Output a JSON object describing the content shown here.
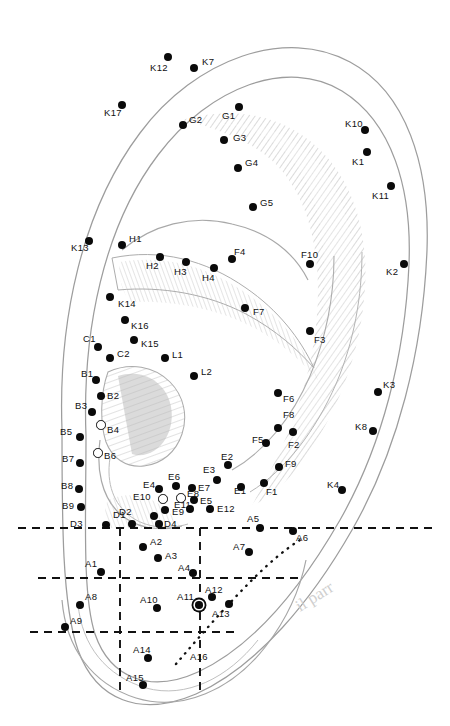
{
  "figure": {
    "subtitle": "Right ear, lateral view with lettered point zones",
    "background_color": "#ffffff",
    "dot_color": "#0a0a0a",
    "outline_color": "#9a9a9a",
    "grid_color": "#111111",
    "watermark_text": "il parr"
  },
  "marker_styles": {
    "filled": "solid black disc",
    "hollow": "open circle outline",
    "target": "black disc with outer ring"
  },
  "chart_data": {
    "type": "scatter",
    "xlabel": "",
    "ylabel": "",
    "xlim": [
      0,
      450
    ],
    "ylim": [
      0,
      726
    ],
    "grid": true,
    "legend": "none",
    "groups": [
      "A",
      "B",
      "C",
      "D",
      "E",
      "F",
      "G",
      "H",
      "K",
      "L"
    ],
    "points": [
      {
        "id": "K12",
        "x": 168,
        "y": 57,
        "lx": 150,
        "ly": 68,
        "style": "filled"
      },
      {
        "id": "K7",
        "x": 194,
        "y": 68,
        "lx": 202,
        "ly": 62,
        "style": "filled"
      },
      {
        "id": "K17",
        "x": 122,
        "y": 105,
        "lx": 104,
        "ly": 113,
        "style": "filled"
      },
      {
        "id": "G2",
        "x": 183,
        "y": 125,
        "lx": 189,
        "ly": 120,
        "style": "filled"
      },
      {
        "id": "G1",
        "x": 239,
        "y": 107,
        "lx": 222,
        "ly": 116,
        "style": "filled"
      },
      {
        "id": "G3",
        "x": 224,
        "y": 140,
        "lx": 233,
        "ly": 138,
        "style": "filled"
      },
      {
        "id": "G4",
        "x": 238,
        "y": 168,
        "lx": 245,
        "ly": 163,
        "style": "filled"
      },
      {
        "id": "G5",
        "x": 253,
        "y": 207,
        "lx": 260,
        "ly": 203,
        "style": "filled"
      },
      {
        "id": "K10",
        "x": 365,
        "y": 130,
        "lx": 345,
        "ly": 124,
        "style": "filled"
      },
      {
        "id": "K1",
        "x": 367,
        "y": 152,
        "lx": 352,
        "ly": 162,
        "style": "filled"
      },
      {
        "id": "K11",
        "x": 391,
        "y": 186,
        "lx": 372,
        "ly": 196,
        "style": "filled"
      },
      {
        "id": "K2",
        "x": 404,
        "y": 264,
        "lx": 386,
        "ly": 272,
        "style": "filled"
      },
      {
        "id": "K13",
        "x": 89,
        "y": 241,
        "lx": 71,
        "ly": 248,
        "style": "filled"
      },
      {
        "id": "H1",
        "x": 122,
        "y": 245,
        "lx": 129,
        "ly": 239,
        "style": "filled"
      },
      {
        "id": "H2",
        "x": 160,
        "y": 257,
        "lx": 146,
        "ly": 266,
        "style": "filled"
      },
      {
        "id": "H3",
        "x": 186,
        "y": 262,
        "lx": 174,
        "ly": 272,
        "style": "filled"
      },
      {
        "id": "H4",
        "x": 214,
        "y": 268,
        "lx": 202,
        "ly": 278,
        "style": "filled"
      },
      {
        "id": "F4",
        "x": 232,
        "y": 259,
        "lx": 234,
        "ly": 252,
        "style": "filled"
      },
      {
        "id": "F10",
        "x": 310,
        "y": 264,
        "lx": 301,
        "ly": 255,
        "style": "filled"
      },
      {
        "id": "F7",
        "x": 245,
        "y": 308,
        "lx": 253,
        "ly": 312,
        "style": "filled"
      },
      {
        "id": "F3",
        "x": 310,
        "y": 331,
        "lx": 314,
        "ly": 340,
        "style": "filled"
      },
      {
        "id": "K14",
        "x": 110,
        "y": 297,
        "lx": 118,
        "ly": 304,
        "style": "filled"
      },
      {
        "id": "K16",
        "x": 125,
        "y": 320,
        "lx": 131,
        "ly": 326,
        "style": "filled"
      },
      {
        "id": "K15",
        "x": 134,
        "y": 340,
        "lx": 141,
        "ly": 344,
        "style": "filled"
      },
      {
        "id": "C1",
        "x": 98,
        "y": 347,
        "lx": 83,
        "ly": 339,
        "style": "filled"
      },
      {
        "id": "C2",
        "x": 110,
        "y": 358,
        "lx": 117,
        "ly": 354,
        "style": "filled"
      },
      {
        "id": "L1",
        "x": 165,
        "y": 358,
        "lx": 172,
        "ly": 355,
        "style": "filled"
      },
      {
        "id": "L2",
        "x": 194,
        "y": 376,
        "lx": 201,
        "ly": 372,
        "style": "filled"
      },
      {
        "id": "B1",
        "x": 96,
        "y": 380,
        "lx": 81,
        "ly": 374,
        "style": "filled"
      },
      {
        "id": "B2",
        "x": 101,
        "y": 396,
        "lx": 107,
        "ly": 396,
        "style": "filled"
      },
      {
        "id": "B3",
        "x": 92,
        "y": 412,
        "lx": 75,
        "ly": 406,
        "style": "filled"
      },
      {
        "id": "B4",
        "x": 100,
        "y": 424,
        "lx": 107,
        "ly": 430,
        "style": "hollow"
      },
      {
        "id": "B5",
        "x": 80,
        "y": 437,
        "lx": 60,
        "ly": 432,
        "style": "filled"
      },
      {
        "id": "B6",
        "x": 97,
        "y": 452,
        "lx": 104,
        "ly": 456,
        "style": "hollow"
      },
      {
        "id": "B7",
        "x": 80,
        "y": 463,
        "lx": 62,
        "ly": 459,
        "style": "filled"
      },
      {
        "id": "B8",
        "x": 79,
        "y": 489,
        "lx": 61,
        "ly": 486,
        "style": "filled"
      },
      {
        "id": "B9",
        "x": 81,
        "y": 507,
        "lx": 62,
        "ly": 506,
        "style": "filled"
      },
      {
        "id": "D3",
        "x": 106,
        "y": 525,
        "lx": 70,
        "ly": 524,
        "style": "filled"
      },
      {
        "id": "D1",
        "x": 132,
        "y": 524,
        "lx": 113,
        "ly": 515,
        "style": "filled"
      },
      {
        "id": "D2",
        "x": 154,
        "y": 516,
        "lx": 119,
        "ly": 512,
        "style": "filled"
      },
      {
        "id": "D4",
        "x": 159,
        "y": 524,
        "lx": 164,
        "ly": 524,
        "style": "filled"
      },
      {
        "id": "E4",
        "x": 159,
        "y": 489,
        "lx": 143,
        "ly": 485,
        "style": "filled"
      },
      {
        "id": "E6",
        "x": 176,
        "y": 486,
        "lx": 168,
        "ly": 477,
        "style": "filled"
      },
      {
        "id": "E7",
        "x": 192,
        "y": 488,
        "lx": 198,
        "ly": 488,
        "style": "filled"
      },
      {
        "id": "E3",
        "x": 217,
        "y": 480,
        "lx": 203,
        "ly": 470,
        "style": "filled"
      },
      {
        "id": "E1",
        "x": 241,
        "y": 487,
        "lx": 234,
        "ly": 491,
        "style": "filled"
      },
      {
        "id": "E10",
        "x": 162,
        "y": 498,
        "lx": 133,
        "ly": 497,
        "style": "hollow"
      },
      {
        "id": "E8",
        "x": 180,
        "y": 497,
        "lx": 187,
        "ly": 494,
        "style": "hollow"
      },
      {
        "id": "E5",
        "x": 194,
        "y": 500,
        "lx": 200,
        "ly": 501,
        "style": "filled"
      },
      {
        "id": "E9",
        "x": 165,
        "y": 510,
        "lx": 172,
        "ly": 512,
        "style": "filled"
      },
      {
        "id": "E11",
        "x": 190,
        "y": 509,
        "lx": 174,
        "ly": 505,
        "style": "filled"
      },
      {
        "id": "E12",
        "x": 210,
        "y": 509,
        "lx": 217,
        "ly": 509,
        "style": "filled"
      },
      {
        "id": "E2",
        "x": 228,
        "y": 465,
        "lx": 221,
        "ly": 457,
        "style": "filled"
      },
      {
        "id": "F6",
        "x": 278,
        "y": 393,
        "lx": 283,
        "ly": 399,
        "style": "filled"
      },
      {
        "id": "F8",
        "x": 278,
        "y": 428,
        "lx": 283,
        "ly": 415,
        "style": "filled"
      },
      {
        "id": "F2",
        "x": 293,
        "y": 432,
        "lx": 288,
        "ly": 445,
        "style": "filled"
      },
      {
        "id": "F5",
        "x": 266,
        "y": 443,
        "lx": 252,
        "ly": 440,
        "style": "filled"
      },
      {
        "id": "F9",
        "x": 279,
        "y": 467,
        "lx": 285,
        "ly": 464,
        "style": "filled"
      },
      {
        "id": "F1",
        "x": 264,
        "y": 483,
        "lx": 266,
        "ly": 492,
        "style": "filled"
      },
      {
        "id": "K3",
        "x": 378,
        "y": 392,
        "lx": 383,
        "ly": 385,
        "style": "filled"
      },
      {
        "id": "K8",
        "x": 373,
        "y": 431,
        "lx": 355,
        "ly": 427,
        "style": "filled"
      },
      {
        "id": "K4",
        "x": 342,
        "y": 490,
        "lx": 327,
        "ly": 485,
        "style": "filled"
      },
      {
        "id": "A5",
        "x": 260,
        "y": 528,
        "lx": 247,
        "ly": 519,
        "style": "filled"
      },
      {
        "id": "A6",
        "x": 293,
        "y": 531,
        "lx": 296,
        "ly": 538,
        "style": "filled"
      },
      {
        "id": "A7",
        "x": 249,
        "y": 552,
        "lx": 233,
        "ly": 547,
        "style": "filled"
      },
      {
        "id": "A2",
        "x": 143,
        "y": 547,
        "lx": 150,
        "ly": 542,
        "style": "filled"
      },
      {
        "id": "A3",
        "x": 158,
        "y": 558,
        "lx": 165,
        "ly": 556,
        "style": "filled"
      },
      {
        "id": "A1",
        "x": 101,
        "y": 572,
        "lx": 85,
        "ly": 564,
        "style": "filled"
      },
      {
        "id": "A4",
        "x": 193,
        "y": 573,
        "lx": 178,
        "ly": 568,
        "style": "filled"
      },
      {
        "id": "A11",
        "x": 199,
        "y": 605,
        "lx": 177,
        "ly": 597,
        "style": "target"
      },
      {
        "id": "A12",
        "x": 212,
        "y": 597,
        "lx": 205,
        "ly": 590,
        "style": "filled"
      },
      {
        "id": "A13",
        "x": 229,
        "y": 604,
        "lx": 212,
        "ly": 614,
        "style": "filled"
      },
      {
        "id": "A8",
        "x": 80,
        "y": 605,
        "lx": 85,
        "ly": 597,
        "style": "filled"
      },
      {
        "id": "A10",
        "x": 157,
        "y": 608,
        "lx": 140,
        "ly": 600,
        "style": "filled"
      },
      {
        "id": "A9",
        "x": 65,
        "y": 627,
        "lx": 70,
        "ly": 621,
        "style": "filled"
      },
      {
        "id": "A14",
        "x": 148,
        "y": 658,
        "lx": 133,
        "ly": 650,
        "style": "filled"
      },
      {
        "id": "A16",
        "x": 186,
        "y": 655,
        "lx": 190,
        "ly": 657,
        "style": "none"
      },
      {
        "id": "A15",
        "x": 143,
        "y": 685,
        "lx": 126,
        "ly": 678,
        "style": "filled"
      }
    ]
  },
  "grid_lines": {
    "horizontal": [
      {
        "y": 528,
        "x1": 18,
        "x2": 432
      },
      {
        "y": 578,
        "x1": 38,
        "x2": 300
      },
      {
        "y": 632,
        "x1": 30,
        "x2": 238
      }
    ],
    "vertical": [
      {
        "x": 120,
        "y1": 528,
        "y2": 690
      },
      {
        "x": 200,
        "y1": 528,
        "y2": 690
      }
    ],
    "style": "dashed"
  }
}
